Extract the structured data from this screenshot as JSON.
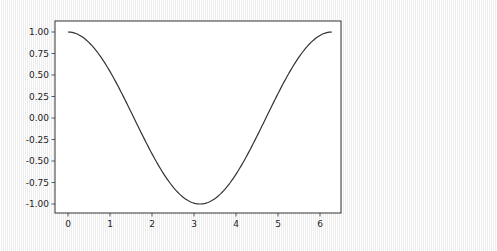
{
  "chart_data": {
    "type": "line",
    "title": "",
    "xlabel": "",
    "ylabel": "",
    "xlim": [
      -0.314,
      6.597
    ],
    "ylim": [
      -1.1,
      1.1
    ],
    "grid": false,
    "legend": null,
    "xticks": [
      0,
      1,
      2,
      3,
      4,
      5,
      6
    ],
    "xtick_labels": [
      "0",
      "1",
      "2",
      "3",
      "4",
      "5",
      "6"
    ],
    "yticks": [
      1.0,
      0.75,
      0.5,
      0.25,
      0.0,
      -0.25,
      -0.5,
      -0.75,
      -1.0
    ],
    "ytick_labels": [
      "1.00",
      "0.75",
      "0.50",
      "0.25",
      "0.00",
      "-0.25",
      "-0.50",
      "-0.75",
      "-1.00"
    ],
    "series": [
      {
        "name": "cos(x)",
        "color": "#333333",
        "function": "cos",
        "x_range": [
          0,
          6.2832
        ],
        "x": [
          0,
          0.5,
          1.0,
          1.5,
          2.0,
          2.5,
          3.0,
          3.1416,
          3.5,
          4.0,
          4.5,
          5.0,
          5.5,
          6.0,
          6.2832
        ],
        "y": [
          1.0,
          0.878,
          0.54,
          0.071,
          -0.416,
          -0.801,
          -0.99,
          -1.0,
          -0.936,
          -0.654,
          -0.211,
          0.284,
          0.709,
          0.96,
          1.0
        ]
      }
    ]
  },
  "plot": {
    "frame_color": "#333333",
    "background": "#ffffff"
  }
}
